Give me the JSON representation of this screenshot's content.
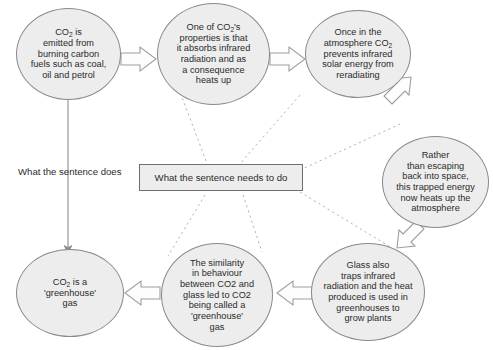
{
  "diagram": {
    "background_color": "#ffffff",
    "node_fill": "#ededed",
    "node_stroke": "#8a8a8a",
    "arrow_fill": "#ffffff",
    "arrow_stroke": "#9a9a9a",
    "dotted_line_color": "#b0b0b0",
    "labels": {
      "left_label": "What the sentence does",
      "center_box": "What the sentence needs to do"
    },
    "nodes": [
      {
        "id": "co2-emitted",
        "shape": "ellipse",
        "text": "CO2 is\nemitted from\nburning carbon\nfuels such as coal,\noil and petrol",
        "line1": "CO",
        "sub1": "2",
        "line1b": " is",
        "rest": "emitted from\nburning carbon\nfuels such as coal,\noil and petrol"
      },
      {
        "id": "co2-properties",
        "shape": "ellipse",
        "text": "One of CO2's\nproperties is that\nit absorbs infrared\nradiation and as\na consequence\nheats up",
        "line1": "One of CO",
        "sub1": "2",
        "line1b": "'s",
        "rest": "properties is that\nit absorbs infrared\nradiation and as\na consequence\nheats up"
      },
      {
        "id": "once-in-atmosphere",
        "shape": "ellipse",
        "text": "Once in the\natmosphere CO2\nprevents infrared\nsolar energy from\nreradiating",
        "pre": "Once in the\natmosphere CO",
        "sub1": "2",
        "rest": "prevents infrared\nsolar energy from\nreradiating"
      },
      {
        "id": "rather-than-escaping",
        "shape": "ellipse",
        "text": "Rather\nthan escaping\nback into space,\nthis trapped energy\nnow heats up the\natmosphere"
      },
      {
        "id": "glass-also-traps",
        "shape": "ellipse",
        "text": "Glass also\ntraps infrared\nradiation and the heat\nproduced is used in\ngreenhouses to\ngrow plants"
      },
      {
        "id": "similarity-in-behaviour",
        "shape": "ellipse",
        "text": "The similarity\nin behaviour\nbetween CO2 and\nglass led to CO2\nbeing called a\n'greenhouse'\ngas"
      },
      {
        "id": "co2-greenhouse-gas",
        "shape": "ellipse",
        "text": "CO2 is a\n'greenhouse'\ngas",
        "line1": "CO",
        "sub1": "2",
        "line1b": " is a",
        "rest": "'greenhouse'\ngas"
      }
    ]
  }
}
